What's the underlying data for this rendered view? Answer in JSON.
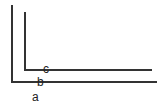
{
  "diagram": {
    "labels": {
      "a": "a",
      "b": "b",
      "c": "c"
    },
    "line_color": "#333333",
    "background": "#ffffff",
    "outer_axis": {
      "vertical": {
        "x": 12,
        "y1": 5,
        "y2": 82
      },
      "horizontal": {
        "y": 82,
        "x1": 12,
        "x2": 157
      }
    },
    "inner_axis": {
      "vertical": {
        "x": 25,
        "y1": 12,
        "y2": 70
      },
      "horizontal": {
        "y": 69,
        "x1": 25,
        "x2": 152
      }
    }
  }
}
